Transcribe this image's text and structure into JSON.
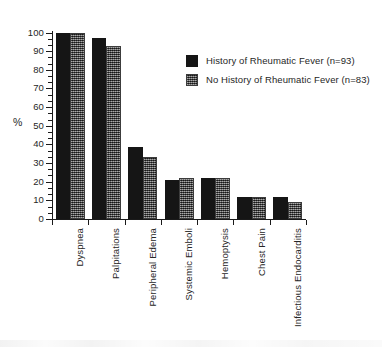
{
  "chart_data": {
    "type": "bar",
    "title": "",
    "subtitle": "",
    "xlabel": "",
    "ylabel": "%",
    "ylim": [
      0,
      100
    ],
    "ytick_step": 10,
    "minor_ticks": true,
    "grid": false,
    "legend_position": "upper-right-inside",
    "orientation": "vertical",
    "grouping": "clustered",
    "categories": [
      "Dyspnea",
      "Palpitations",
      "Peripheral Edema",
      "Systemic Emboli",
      "Hemoptysis",
      "Chest Pain",
      "Infectious Endocarditis"
    ],
    "category_label_rotation": -90,
    "ytick_labels": [
      "0",
      "10",
      "20",
      "30",
      "40",
      "50",
      "60",
      "70",
      "80",
      "90",
      "100"
    ],
    "ytick_values": [
      0,
      10,
      20,
      30,
      40,
      50,
      60,
      70,
      80,
      90,
      100
    ],
    "series": [
      {
        "name": "History of Rheumatic Fever (n=93)",
        "n": 93,
        "fill": "solid-black",
        "color": "#151515",
        "values": [
          100,
          97,
          38.5,
          21,
          22,
          12,
          12
        ]
      },
      {
        "name": "No History of Rheumatic Fever (n=83)",
        "n": 83,
        "fill": "dithered-gray",
        "color": "#5b5b5b",
        "values": [
          100,
          93,
          33.5,
          22,
          22,
          12,
          9
        ]
      }
    ]
  },
  "legend": {
    "items": [
      {
        "label": "History of Rheumatic Fever (n=93)",
        "swatch": "solid"
      },
      {
        "label": "No History of Rheumatic Fever (n=83)",
        "swatch": "dither"
      }
    ]
  },
  "axes": {
    "y_title": "%"
  }
}
